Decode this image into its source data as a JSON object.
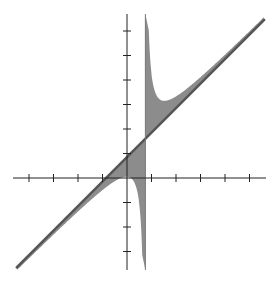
{
  "chart_data": {
    "type": "area",
    "title": "",
    "xlabel": "",
    "ylabel": "",
    "xlim": [
      -4.6,
      5.7
    ],
    "ylim": [
      -3.7,
      6.5
    ],
    "grid": false,
    "legend": null,
    "tick_labels_shown": false,
    "x_ticks": [
      -4,
      -3,
      -2,
      -1,
      1,
      2,
      3,
      4,
      5
    ],
    "y_ticks": [
      -3,
      -2,
      -1,
      1,
      2,
      3,
      4,
      5,
      6
    ],
    "asymptotes": {
      "vertical_x": 0.75,
      "oblique": "y = x + 0.85"
    },
    "series": [
      {
        "name": "oblique line",
        "kind": "line",
        "points": [
          [
            -4.5,
            -3.65
          ],
          [
            5.6,
            6.45
          ]
        ]
      },
      {
        "name": "shaded region between line and rational curve",
        "kind": "filled-area",
        "fill": "#8a8a8a",
        "description": "Rational function curve approaching the line y=x+0.85 and the vertical asymptote x=0.75; region between curve and line is shaded"
      }
    ]
  },
  "colors": {
    "axis": "#222222",
    "fill": "#8c8c8c",
    "line": "#555555",
    "background": "#ffffff"
  },
  "labels": {
    "title_hidden": "Graph of a rational function with oblique asymptote"
  }
}
